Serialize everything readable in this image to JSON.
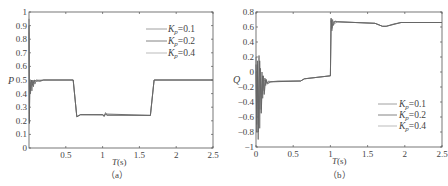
{
  "chart_data": [
    {
      "type": "line",
      "panel_caption": "（a）",
      "title": "",
      "xlabel": "T(s)",
      "ylabel": "P",
      "xlim": [
        0,
        2.5
      ],
      "ylim": [
        0,
        1
      ],
      "xticks": [
        "0.5",
        "1",
        "1.5",
        "2",
        "2.5"
      ],
      "yticks": [
        "0",
        "0.1",
        "0.2",
        "0.3",
        "0.4",
        "0.5",
        "0.6",
        "0.7",
        "0.8",
        "0.9",
        "1"
      ],
      "grid": false,
      "legend_position": "upper right",
      "legend": [
        "Kp=0.1",
        "Kp=0.2",
        "Kp=0.4"
      ],
      "series": [
        {
          "name": "Kp=0.1",
          "color": "#666666",
          "x": [
            0,
            0.005,
            0.01,
            0.02,
            0.03,
            0.04,
            0.05,
            0.06,
            0.07,
            0.08,
            0.1,
            0.15,
            0.2,
            0.6,
            0.65,
            0.7,
            1.0,
            1.02,
            1.04,
            1.06,
            1.65,
            1.7,
            2.5
          ],
          "y": [
            0.95,
            0.2,
            0.5,
            0.4,
            0.49,
            0.42,
            0.5,
            0.45,
            0.5,
            0.47,
            0.5,
            0.49,
            0.5,
            0.5,
            0.23,
            0.245,
            0.245,
            0.23,
            0.26,
            0.24,
            0.24,
            0.5,
            0.5
          ]
        },
        {
          "name": "Kp=0.2",
          "color": "#555555",
          "x": [
            0,
            0.005,
            0.01,
            0.02,
            0.03,
            0.05,
            0.07,
            0.1,
            0.2,
            0.6,
            0.65,
            0.7,
            1.0,
            1.02,
            1.04,
            1.65,
            1.7,
            2.5
          ],
          "y": [
            0.9,
            0.18,
            0.48,
            0.42,
            0.5,
            0.46,
            0.5,
            0.49,
            0.5,
            0.5,
            0.23,
            0.245,
            0.245,
            0.235,
            0.25,
            0.24,
            0.5,
            0.5
          ]
        },
        {
          "name": "Kp=0.4",
          "color": "#999999",
          "x": [
            0,
            0.005,
            0.015,
            0.03,
            0.05,
            0.1,
            0.6,
            0.65,
            0.7,
            1.65,
            1.7,
            2.5
          ],
          "y": [
            0.85,
            0.25,
            0.47,
            0.5,
            0.48,
            0.5,
            0.5,
            0.23,
            0.245,
            0.24,
            0.5,
            0.5
          ]
        }
      ]
    },
    {
      "type": "line",
      "panel_caption": "（b）",
      "title": "",
      "xlabel": "T(s)",
      "ylabel": "Q",
      "xlim": [
        0,
        2.5
      ],
      "ylim": [
        -1,
        0.8
      ],
      "xticks": [
        "0",
        "0.5",
        "1",
        "1.5",
        "2",
        "2.5"
      ],
      "yticks": [
        "-1",
        "-0.8",
        "-0.6",
        "-0.4",
        "-0.2",
        "0",
        "0.2",
        "0.4",
        "0.6",
        "0.8"
      ],
      "grid": false,
      "legend_position": "lower right",
      "legend": [
        "Kp=0.1",
        "Kp=0.2",
        "Kp=0.4"
      ],
      "series": [
        {
          "name": "Kp=0.1",
          "color": "#666666",
          "x": [
            0,
            0.01,
            0.02,
            0.03,
            0.04,
            0.05,
            0.06,
            0.07,
            0.08,
            0.09,
            0.1,
            0.11,
            0.12,
            0.13,
            0.14,
            0.15,
            0.17,
            0.2,
            0.3,
            0.6,
            0.65,
            1.0,
            1.01,
            1.02,
            1.03,
            1.04,
            1.06,
            1.1,
            1.6,
            1.7,
            1.75,
            1.85,
            1.95,
            2.5
          ],
          "y": [
            0.2,
            -0.8,
            0.15,
            -0.9,
            0.22,
            -0.75,
            0.05,
            -0.5,
            0.0,
            -0.35,
            -0.05,
            -0.25,
            -0.08,
            -0.18,
            -0.1,
            -0.15,
            -0.12,
            -0.13,
            -0.12,
            -0.12,
            -0.09,
            -0.05,
            0.72,
            0.55,
            0.7,
            0.62,
            0.68,
            0.67,
            0.65,
            0.61,
            0.61,
            0.64,
            0.66,
            0.66
          ]
        },
        {
          "name": "Kp=0.2",
          "color": "#555555",
          "x": [
            0,
            0.01,
            0.02,
            0.03,
            0.05,
            0.07,
            0.09,
            0.11,
            0.13,
            0.15,
            0.2,
            0.6,
            0.65,
            1.0,
            1.01,
            1.02,
            1.04,
            1.1,
            1.6,
            1.7,
            1.75,
            1.95,
            2.5
          ],
          "y": [
            0.1,
            -0.7,
            0.1,
            -0.8,
            0.15,
            -0.55,
            -0.05,
            -0.3,
            -0.1,
            -0.16,
            -0.13,
            -0.12,
            -0.09,
            -0.05,
            0.7,
            0.58,
            0.67,
            0.67,
            0.65,
            0.61,
            0.61,
            0.66,
            0.66
          ]
        },
        {
          "name": "Kp=0.4",
          "color": "#999999",
          "x": [
            0,
            0.01,
            0.02,
            0.04,
            0.06,
            0.08,
            0.1,
            0.15,
            0.2,
            0.6,
            0.65,
            1.0,
            1.01,
            1.03,
            1.1,
            1.6,
            1.7,
            1.75,
            1.95,
            2.5
          ],
          "y": [
            0.0,
            -0.6,
            -0.05,
            -0.5,
            -0.08,
            -0.3,
            -0.1,
            -0.14,
            -0.13,
            -0.12,
            -0.09,
            -0.05,
            0.68,
            0.63,
            0.67,
            0.65,
            0.61,
            0.61,
            0.66,
            0.66
          ]
        }
      ]
    }
  ],
  "labels": {
    "a": {
      "ylabel": "P",
      "xlabel_T": "T",
      "xlabel_unit": "(s)",
      "caption": "（a）",
      "legend": [
        {
          "k": "K",
          "sub": "p",
          "val": "=0.1"
        },
        {
          "k": "K",
          "sub": "p",
          "val": "=0.2"
        },
        {
          "k": "K",
          "sub": "p",
          "val": "=0.4"
        }
      ],
      "yticks": [
        "0",
        "0.1",
        "0.2",
        "0.3",
        "0.4",
        "0.5",
        "0.6",
        "0.7",
        "0.8",
        "0.9",
        "1"
      ],
      "xticks": [
        "0.5",
        "1",
        "1.5",
        "2",
        "2.5"
      ]
    },
    "b": {
      "ylabel": "Q",
      "xlabel_T": "T",
      "xlabel_unit": "(s)",
      "caption": "（b）",
      "legend": [
        {
          "k": "K",
          "sub": "p",
          "val": "=0.1"
        },
        {
          "k": "K",
          "sub": "p",
          "val": "=0.2"
        },
        {
          "k": "K",
          "sub": "p",
          "val": "=0.4"
        }
      ],
      "yticks": [
        "−1",
        "−0.8",
        "−0.6",
        "−0.4",
        "−0.2",
        "0",
        "0.2",
        "0.4",
        "0.6",
        "0.8"
      ],
      "xticks": [
        "0",
        "0.5",
        "1",
        "1.5",
        "2",
        "2.5"
      ]
    }
  }
}
